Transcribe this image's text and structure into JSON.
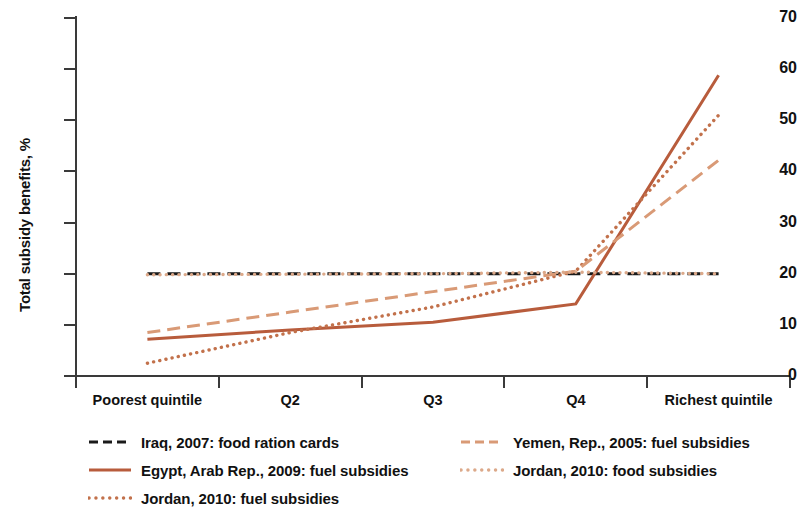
{
  "chart_data": {
    "type": "line",
    "title": "",
    "xlabel": "",
    "ylabel": "Total subsidy benefits, %",
    "categories": [
      "Poorest quintile",
      "Q2",
      "Q3",
      "Q4",
      "Richest quintile"
    ],
    "ylim": [
      0,
      70
    ],
    "yticks": [
      0,
      10,
      20,
      30,
      40,
      50,
      60,
      70
    ],
    "grid": false,
    "legend_position": "below",
    "series": [
      {
        "name": "Iraq, 2007: food ration cards",
        "values": [
          20.0,
          20.0,
          20.0,
          20.0,
          20.0
        ],
        "color": "#1a1a1a",
        "style": "dashed"
      },
      {
        "name": "Egypt, Arab Rep., 2009: fuel subsidies",
        "values": [
          7.2,
          9.0,
          10.5,
          14.1,
          58.8
        ],
        "color": "#b85c3c",
        "style": "solid"
      },
      {
        "name": "Jordan, 2010: fuel subsidies",
        "values": [
          2.5,
          8.5,
          13.5,
          20.5,
          51.0
        ],
        "color": "#c2714b",
        "style": "dotted"
      },
      {
        "name": "Yemen, Rep., 2005: fuel subsidies",
        "values": [
          8.5,
          12.5,
          16.5,
          20.5,
          42.2
        ],
        "color": "#d99a76",
        "style": "dashed"
      },
      {
        "name": "Jordan, 2010: food subsidies",
        "values": [
          19.8,
          19.9,
          20.0,
          20.3,
          20.0
        ],
        "color": "#dca98a",
        "style": "dotted"
      }
    ]
  },
  "axis": {
    "y_title": "Total subsidy benefits, %",
    "y_tick_labels": [
      "70",
      "60",
      "50",
      "40",
      "30",
      "20",
      "10",
      "0"
    ],
    "x_tick_labels": [
      "Poorest quintile",
      "Q2",
      "Q3",
      "Q4",
      "Richest quintile"
    ]
  },
  "legend": {
    "entries": [
      {
        "label": "Iraq, 2007: food ration cards",
        "color": "#1a1a1a",
        "style": "dashed",
        "column": 1,
        "row": 1
      },
      {
        "label": "Yemen, Rep., 2005: fuel subsidies",
        "color": "#d99a76",
        "style": "dashed",
        "column": 2,
        "row": 1
      },
      {
        "label": "Egypt, Arab Rep., 2009: fuel subsidies",
        "color": "#b85c3c",
        "style": "solid",
        "column": 1,
        "row": 2
      },
      {
        "label": "Jordan, 2010: food subsidies",
        "color": "#dca98a",
        "style": "dotted",
        "column": 2,
        "row": 2
      },
      {
        "label": "Jordan, 2010: fuel subsidies",
        "color": "#c2714b",
        "style": "dotted",
        "column": 1,
        "row": 3
      }
    ]
  }
}
